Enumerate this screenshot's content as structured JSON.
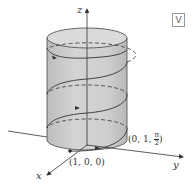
{
  "figure": {
    "type": "helix on cylinder",
    "axes": {
      "x": "x",
      "y": "y",
      "z": "z"
    },
    "points": [
      {
        "label": "(1, 0, 0)"
      },
      {
        "label_prefix": "(0, 1, ",
        "numerator": "π",
        "denominator": "2",
        "label_suffix": ")"
      }
    ],
    "badge": "V"
  },
  "colors": {
    "cylinder_fill": "#c9c9c9",
    "cylinder_top": "#d8d8d8",
    "stroke": "#333333"
  }
}
